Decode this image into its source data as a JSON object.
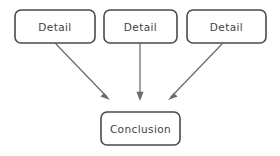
{
  "diagram": {
    "background_color": "#ffffff",
    "stroke_color": "#4a4a4f",
    "arrow_color": "#6a6a70",
    "text_color": "#3f3f44",
    "nodes": [
      {
        "id": "detail-1",
        "label": "Detail",
        "shape": "rounded-rectangle",
        "x": 15,
        "y": 10,
        "width": 80,
        "height": 33
      },
      {
        "id": "detail-2",
        "label": "Detail",
        "shape": "rounded-rectangle",
        "x": 104,
        "y": 10,
        "width": 73,
        "height": 33
      },
      {
        "id": "detail-3",
        "label": "Detail",
        "shape": "rounded-rectangle",
        "x": 187,
        "y": 10,
        "width": 79,
        "height": 33
      },
      {
        "id": "conclusion",
        "label": "Conclusion",
        "shape": "rounded-rectangle",
        "x": 101,
        "y": 112,
        "width": 79,
        "height": 33
      }
    ],
    "edges": [
      {
        "id": "edge-detail-1-to-conclusion",
        "from": "detail-1",
        "to": "conclusion",
        "direction": "diagonal-down-right",
        "x1": 56,
        "y1": 44,
        "x2": 110,
        "y2": 100
      },
      {
        "id": "edge-detail-2-to-conclusion",
        "from": "detail-2",
        "to": "conclusion",
        "direction": "vertical-down",
        "x1": 140,
        "y1": 44,
        "x2": 140,
        "y2": 100
      },
      {
        "id": "edge-detail-3-to-conclusion",
        "from": "detail-3",
        "to": "conclusion",
        "direction": "diagonal-down-left",
        "x1": 222,
        "y1": 44,
        "x2": 168,
        "y2": 100
      }
    ]
  }
}
